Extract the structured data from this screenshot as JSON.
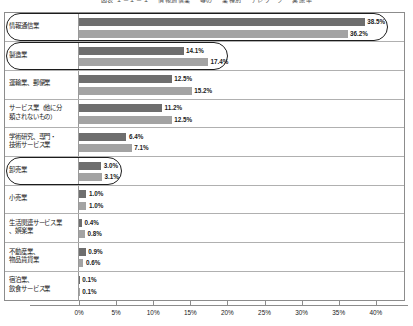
{
  "chart_data": {
    "type": "bar",
    "orientation": "horizontal",
    "title": "図表 １－１－１ 　情報通信業 　等の 　業種別 　テレワーク 　実施率",
    "xlabel": "",
    "ylabel": "",
    "xlim": [
      0,
      43
    ],
    "xticks": [
      "0%",
      "5%",
      "10%",
      "15%",
      "20%",
      "25%",
      "30%",
      "35%",
      "40%"
    ],
    "xtick_values": [
      0,
      5,
      10,
      15,
      20,
      25,
      30,
      35,
      40
    ],
    "grid": false,
    "legend": "none",
    "categories": [
      "情報通信業",
      "製造業",
      "運輸業、郵便業",
      "サービス業（他に分\n類されないもの）",
      "学術研究、専門・\n技術サービス業",
      "卸売業",
      "小売業",
      "生活関連サービス業\n、娯楽業",
      "不動産業、\n物品賃貸業",
      "宿泊業、\n飲食サービス業"
    ],
    "series": [
      {
        "name": "series-1",
        "color": "#6e6e6e",
        "values": [
          38.5,
          14.1,
          12.5,
          11.2,
          6.4,
          3.0,
          1.0,
          0.4,
          0.9,
          0.1
        ],
        "labels": [
          "38.5%",
          "14.1%",
          "12.5%",
          "11.2%",
          "6.4%",
          "3.0%",
          "1.0%",
          "0.4%",
          "0.9%",
          "0.1%"
        ]
      },
      {
        "name": "series-2",
        "color": "#a3a3a3",
        "values": [
          36.2,
          17.4,
          15.2,
          12.5,
          7.1,
          3.1,
          1.0,
          0.8,
          0.6,
          0.1
        ],
        "labels": [
          "36.2%",
          "17.4%",
          "15.2%",
          "12.5%",
          "7.1%",
          "3.1%",
          "1.0%",
          "0.8%",
          "0.6%",
          "0.1%"
        ]
      }
    ],
    "annotations": [
      {
        "name": "highlight-information-communications",
        "category": "情報通信業"
      },
      {
        "name": "highlight-manufacturing",
        "category": "製造業"
      },
      {
        "name": "highlight-wholesale",
        "category": "卸売業"
      }
    ]
  }
}
